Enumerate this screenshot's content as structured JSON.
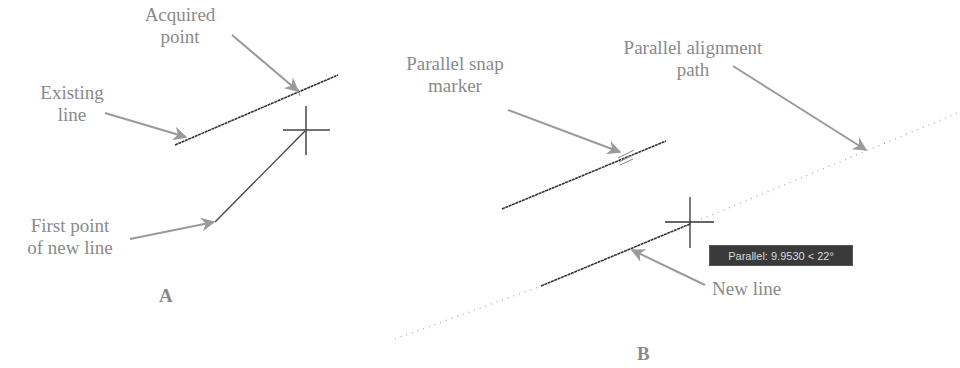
{
  "colors": {
    "label": "#8a8a8a",
    "arrow": "#9a9a9a",
    "cad_line": "#333333",
    "tooltip_bg": "#3a3a3a",
    "tooltip_text": "#d8d8d8"
  },
  "panel_a": {
    "letter": "A",
    "labels": {
      "acquired_point": [
        "Acquired",
        "point"
      ],
      "existing_line": [
        "Existing",
        "line"
      ],
      "first_point": [
        "First point",
        "of new line"
      ]
    }
  },
  "panel_b": {
    "letter": "B",
    "labels": {
      "parallel_snap_marker": [
        "Parallel snap",
        "marker"
      ],
      "parallel_alignment_path": [
        "Parallel alignment",
        "path"
      ],
      "new_line": [
        "New line"
      ]
    },
    "tooltip": "Parallel: 9.9530 < 22°"
  }
}
